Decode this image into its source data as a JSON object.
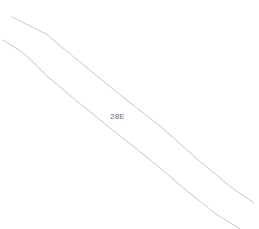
{
  "canvas": {
    "width": 259,
    "height": 229,
    "background": "#ffffff"
  },
  "style": {
    "line_color": "#b8b8b8",
    "line_width": 0.8,
    "label_color": "#6d6d6d",
    "label_font_size": 8
  },
  "diagram": {
    "type": "line-drawing",
    "strokes": [
      {
        "name": "upper-line",
        "points": "12,17 46,34 86,67 124,98 160,126 196,158 232,188 254,203"
      },
      {
        "name": "lower-line",
        "points": "3,40 22,52 33,62 48,77 78,102 110,128 148,158 186,190 216,214 240,229"
      }
    ]
  },
  "labels": [
    {
      "name": "part-label-28e",
      "text": "28E",
      "x": 110,
      "y": 112
    }
  ]
}
